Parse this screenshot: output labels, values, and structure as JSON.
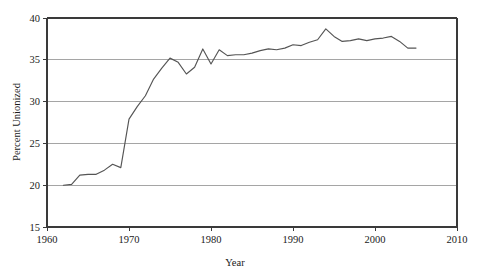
{
  "chart_data": {
    "type": "line",
    "title": "",
    "xlabel": "Year",
    "ylabel": "Percent Unionized",
    "xlim": [
      1960,
      2010
    ],
    "ylim": [
      15,
      40
    ],
    "xticks": [
      1960,
      1970,
      1980,
      1990,
      2000,
      2010
    ],
    "yticks": [
      15,
      20,
      25,
      30,
      35,
      40
    ],
    "grid": "horizontal",
    "legend": "none",
    "line_color": "#555555",
    "grid_color": "#9b9b9b",
    "axis_color": "#3a3a3a",
    "x": [
      1962,
      1963,
      1964,
      1965,
      1966,
      1967,
      1968,
      1969,
      1970,
      1971,
      1972,
      1973,
      1974,
      1975,
      1976,
      1977,
      1978,
      1979,
      1980,
      1981,
      1982,
      1983,
      1984,
      1985,
      1986,
      1987,
      1988,
      1989,
      1990,
      1991,
      1992,
      1993,
      1994,
      1995,
      1996,
      1997,
      1998,
      1999,
      2000,
      2001,
      2002,
      2003,
      2004,
      2005
    ],
    "y": [
      20.0,
      20.1,
      21.2,
      21.3,
      21.3,
      21.8,
      22.5,
      22.1,
      27.9,
      29.4,
      30.7,
      32.7,
      34.0,
      35.2,
      34.7,
      33.3,
      34.1,
      36.3,
      34.5,
      36.2,
      35.5,
      35.6,
      35.6,
      35.8,
      36.1,
      36.3,
      36.2,
      36.4,
      36.8,
      36.7,
      37.1,
      37.4,
      38.7,
      37.8,
      37.2,
      37.3,
      37.5,
      37.3,
      37.5,
      37.6,
      37.8,
      37.2,
      36.4,
      36.4
    ]
  },
  "axes": {
    "y_title": "Percent Unionized",
    "x_title": "Year",
    "y_tick_labels": [
      "15",
      "20",
      "25",
      "30",
      "35",
      "40"
    ],
    "x_tick_labels": [
      "1960",
      "1970",
      "1980",
      "1990",
      "2000",
      "2010"
    ]
  }
}
